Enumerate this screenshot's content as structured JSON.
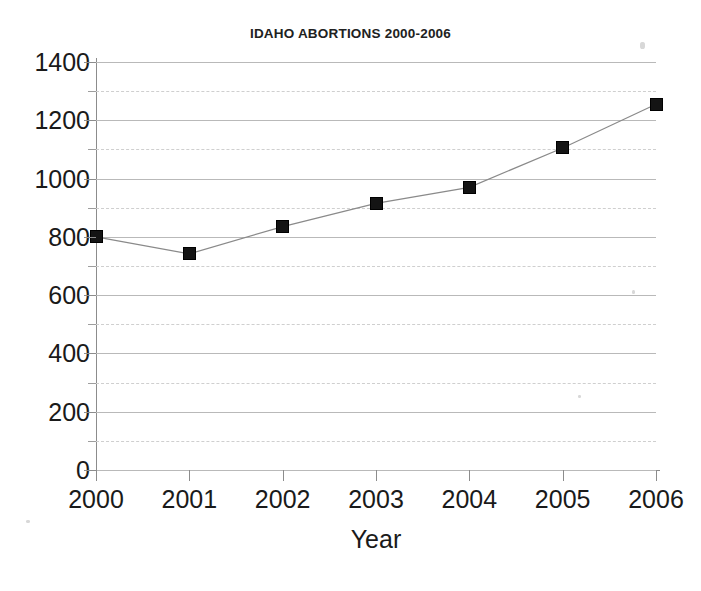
{
  "chart_data": {
    "type": "line",
    "title": "IDAHO ABORTIONS 2000-2006",
    "xlabel": "Year",
    "ylabel": "",
    "categories": [
      "2000",
      "2001",
      "2002",
      "2003",
      "2004",
      "2005",
      "2006"
    ],
    "values": [
      800,
      742,
      835,
      915,
      970,
      1105,
      1255
    ],
    "series": [
      {
        "name": "Idaho abortions",
        "values": [
          800,
          742,
          835,
          915,
          970,
          1105,
          1255
        ]
      }
    ],
    "xlim": [
      2000,
      2006
    ],
    "ylim": [
      0,
      1400
    ],
    "y_major_ticks": [
      0,
      200,
      400,
      600,
      800,
      1000,
      1200,
      1400
    ],
    "y_minor_ticks": [
      100,
      300,
      500,
      700,
      900,
      1100,
      1300
    ],
    "y_tick_labels": [
      "0",
      "200",
      "400",
      "600",
      "800",
      "1000",
      "1200",
      "1400"
    ],
    "grid": "horizontal",
    "legend": "none",
    "marker": "square",
    "marker_color": "#141414",
    "line_color": "#8a8a8a"
  },
  "axes": {
    "y_labels": [
      "1400",
      "1200",
      "1000",
      "800",
      "600",
      "400",
      "200",
      "0"
    ],
    "x_labels": [
      "2000",
      "2001",
      "2002",
      "2003",
      "2004",
      "2005",
      "2006"
    ],
    "x_title": "Year"
  },
  "colors": {
    "background": "#ffffff",
    "axis": "#8c8c8c",
    "major_grid": "#b9b9b9",
    "minor_grid": "#cfcfcf",
    "text": "#1a1a1a",
    "marker": "#141414",
    "line": "#8a8a8a"
  }
}
